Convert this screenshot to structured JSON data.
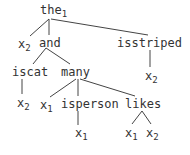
{
  "tree": {
    "nodes": {
      "root": {
        "label": "the",
        "sub": "1"
      },
      "x2_a": {
        "label": "x",
        "sub": "2"
      },
      "and": {
        "label": "and",
        "sub": ""
      },
      "isstriped": {
        "label": "isstriped",
        "sub": ""
      },
      "isstriped_x2": {
        "label": "x",
        "sub": "2"
      },
      "iscat": {
        "label": "iscat",
        "sub": ""
      },
      "iscat_x2": {
        "label": "x",
        "sub": "2"
      },
      "many": {
        "label": "many",
        "sub": ""
      },
      "many_x1": {
        "label": "x",
        "sub": "1"
      },
      "isperson": {
        "label": "isperson",
        "sub": ""
      },
      "isperson_x1": {
        "label": "x",
        "sub": "1"
      },
      "likes": {
        "label": "likes",
        "sub": ""
      },
      "likes_x1": {
        "label": "x",
        "sub": "1"
      },
      "likes_x2": {
        "label": "x",
        "sub": "2"
      }
    },
    "edges": [
      [
        "root",
        "x2_a"
      ],
      [
        "root",
        "and"
      ],
      [
        "root",
        "isstriped"
      ],
      [
        "and",
        "iscat"
      ],
      [
        "and",
        "many"
      ],
      [
        "isstriped",
        "isstriped_x2"
      ],
      [
        "iscat",
        "iscat_x2"
      ],
      [
        "many",
        "many_x1"
      ],
      [
        "many",
        "isperson"
      ],
      [
        "many",
        "likes"
      ],
      [
        "isperson",
        "isperson_x1"
      ],
      [
        "likes",
        "likes_x1"
      ],
      [
        "likes",
        "likes_x2"
      ]
    ]
  }
}
